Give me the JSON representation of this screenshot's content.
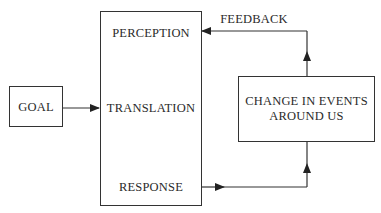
{
  "diagram": {
    "goal": "GOAL",
    "main_box": {
      "perception": "PERCEPTION",
      "translation": "TRANSLATION",
      "response": "RESPONSE"
    },
    "change_box": {
      "line1": "CHANGE IN EVENTS",
      "line2": "AROUND US"
    },
    "feedback": "FEEDBACK"
  },
  "colors": {
    "stroke": "#333333",
    "text": "#2a2a2a",
    "background": "#ffffff"
  }
}
